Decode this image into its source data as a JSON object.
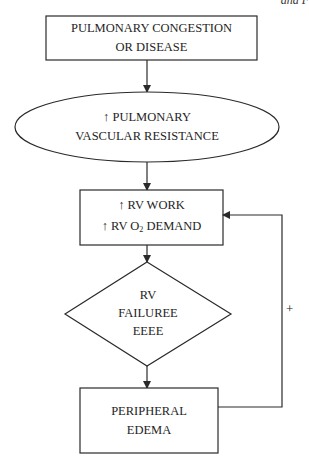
{
  "corner_text": "and F",
  "nodes": [
    {
      "id": "pulmonary-congestion",
      "shape": "rectangle",
      "lines": [
        "PULMONARY CONGESTION",
        "OR DISEASE"
      ]
    },
    {
      "id": "pulmonary-vascular-resistance",
      "shape": "ellipse",
      "lines": [
        "↑ PULMONARY",
        "VASCULAR RESISTANCE"
      ]
    },
    {
      "id": "rv-work",
      "shape": "rectangle",
      "lines": [
        "↑ RV WORK",
        "↑ RV O",
        "2",
        " DEMAND"
      ]
    },
    {
      "id": "rv-failure",
      "shape": "diamond",
      "lines": [
        "RV",
        "FAILUREE",
        "EEEE"
      ]
    },
    {
      "id": "peripheral-edema",
      "shape": "rectangle",
      "lines": [
        "PERIPHERAL",
        "EDEMA"
      ]
    }
  ],
  "edges": [
    {
      "from": "pulmonary-congestion",
      "to": "pulmonary-vascular-resistance"
    },
    {
      "from": "pulmonary-vascular-resistance",
      "to": "rv-work"
    },
    {
      "from": "rv-work",
      "to": "rv-failure"
    },
    {
      "from": "rv-failure",
      "to": "peripheral-edema"
    },
    {
      "from": "peripheral-edema",
      "to": "rv-work",
      "label": "+"
    }
  ],
  "feedback_label": "+",
  "colors": {
    "stroke": "#2a2a2a",
    "background": "#ffffff",
    "text": "#1e1e1e"
  }
}
